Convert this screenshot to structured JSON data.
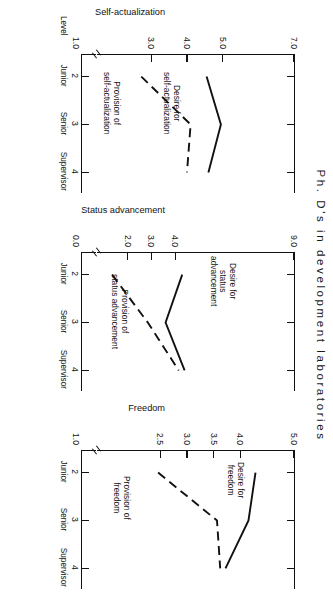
{
  "figure": {
    "title": "Ph. D's in development laboratories",
    "x_axis_title": "Level",
    "x_ticks": [
      {
        "num": "2",
        "cat": "Junior"
      },
      {
        "num": "3",
        "cat": "Senior"
      },
      {
        "num": "4",
        "cat": "Supervisor"
      }
    ]
  },
  "chart_data": [
    {
      "type": "line",
      "title": "Ph. D's in development laboratories",
      "panel": "self-actualization",
      "xlabel": "Level",
      "ylabel": "Self-actualization",
      "x": [
        2,
        3,
        4
      ],
      "categories": [
        "Junior",
        "Senior",
        "Supervisor"
      ],
      "ylim": [
        1.0,
        7.0
      ],
      "ytick_labels": [
        "1.0",
        "3.0",
        "4.0",
        "5.0",
        "7.0"
      ],
      "ytick_values": [
        1.0,
        3.0,
        4.0,
        5.0,
        7.0
      ],
      "axis_break": true,
      "grid": false,
      "legend": "inline-annotations",
      "series": [
        {
          "name": "Desire for self-actualization",
          "style": "solid",
          "values": [
            4.55,
            4.95,
            4.6
          ]
        },
        {
          "name": "Provision of self-actualization",
          "style": "dashed",
          "values": [
            2.72,
            4.1,
            4.0
          ]
        }
      ],
      "annotations": [
        {
          "text": "Desire for\nself-actualization"
        },
        {
          "text": "Provision of\nself-actualization"
        }
      ]
    },
    {
      "type": "line",
      "panel": "status-advancement",
      "xlabel": "Level",
      "ylabel": "Status advancement",
      "x": [
        2,
        3,
        4
      ],
      "categories": [
        "Junior",
        "Senior",
        "Supervisor"
      ],
      "ylim": [
        0.0,
        9.0
      ],
      "ytick_labels": [
        "0.0",
        "2.0",
        "3.0",
        "4.0",
        "9.0"
      ],
      "ytick_values": [
        0.0,
        2.0,
        3.0,
        4.0,
        9.0
      ],
      "axis_break": true,
      "grid": false,
      "legend": "inline-annotations",
      "series": [
        {
          "name": "Desire for status advancement",
          "style": "solid",
          "values": [
            4.3,
            3.6,
            4.4
          ]
        },
        {
          "name": "Provision of status advancement",
          "style": "dashed",
          "values": [
            1.35,
            2.85,
            4.15
          ]
        }
      ],
      "annotations": [
        {
          "text": "Desire for\nstatus\nadvancement"
        },
        {
          "text": "Provision of\nstatus advancement"
        }
      ]
    },
    {
      "type": "line",
      "panel": "freedom",
      "xlabel": "Level",
      "ylabel": "Freedom",
      "x": [
        2,
        3,
        4
      ],
      "categories": [
        "Junior",
        "Senior",
        "Supervisor"
      ],
      "ylim": [
        1.0,
        5.0
      ],
      "ytick_labels": [
        "1.0",
        "2.5",
        "3.0",
        "3.5",
        "4.0",
        "5.0"
      ],
      "ytick_values": [
        1.0,
        2.5,
        3.0,
        3.5,
        4.0,
        5.0
      ],
      "axis_break": true,
      "grid": false,
      "legend": "inline-annotations",
      "series": [
        {
          "name": "Desire for freedom",
          "style": "solid",
          "values": [
            4.28,
            4.15,
            3.72
          ]
        },
        {
          "name": "Provision of freedom",
          "style": "dashed",
          "values": [
            2.46,
            3.56,
            3.62
          ]
        }
      ],
      "annotations": [
        {
          "text": "Desire for\nfreedom"
        },
        {
          "text": "Provision of\nfreedom"
        }
      ]
    }
  ]
}
